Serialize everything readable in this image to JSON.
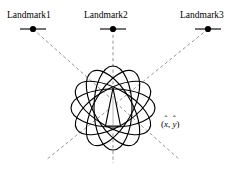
{
  "figure": {
    "kind": "localization-uncertainty-diagram",
    "width": 249,
    "height": 172,
    "background_color": "#ffffff",
    "stroke_color": "#000000",
    "dashed_color": "#7a7a7a"
  },
  "landmarks": [
    {
      "id": "landmark-1",
      "label": "Landmark1",
      "marker_x": 33,
      "marker_y": 29,
      "tick_half_width": 13,
      "dot_radius": 3.1
    },
    {
      "id": "landmark-2",
      "label": "Landmark2",
      "marker_x": 113,
      "marker_y": 29,
      "tick_half_width": 13,
      "dot_radius": 3.1
    },
    {
      "id": "landmark-3",
      "label": "Landmark3",
      "marker_x": 208,
      "marker_y": 29,
      "tick_half_width": 13,
      "dot_radius": 3.1
    }
  ],
  "estimate": {
    "label_open": "(",
    "x_symbol": "x",
    "x_hat": "ˆ",
    "separator": ", ",
    "y_symbol": "y",
    "y_hat": "ˆ",
    "label_close": ")",
    "anchor_x": 113,
    "anchor_y": 108
  },
  "robot": {
    "name": "robot-pose-triangle",
    "apex_x": 113,
    "apex_y": 88,
    "base_y": 126,
    "base_half_width": 7.5
  },
  "uncertainty_ellipses": {
    "count": 6,
    "center_x": 113,
    "center_y": 108,
    "rx": 19,
    "ry": 42,
    "rotations_deg": [
      0,
      30,
      60,
      90,
      120,
      150
    ]
  },
  "bearing_lines": [
    {
      "name": "bearing-line-landmark-1",
      "x1": 33,
      "y1": 29,
      "x2": 180,
      "y2": 160
    },
    {
      "name": "bearing-line-landmark-2",
      "x1": 113,
      "y1": 29,
      "x2": 113,
      "y2": 163
    },
    {
      "name": "bearing-line-landmark-3",
      "x1": 208,
      "y1": 29,
      "x2": 46,
      "y2": 160
    }
  ]
}
